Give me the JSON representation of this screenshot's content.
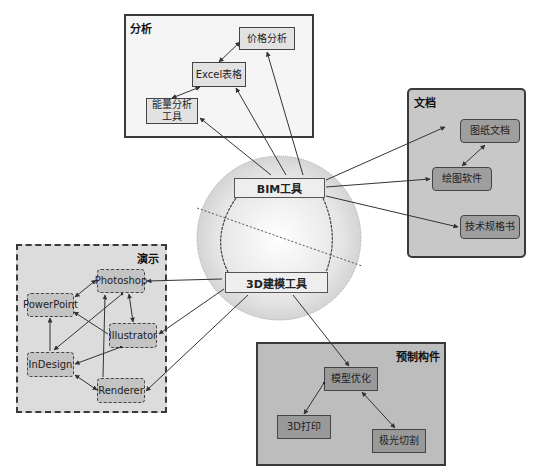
{
  "colors": {
    "analysis_bg": "#f5f5f5",
    "analysis_node": "#e2e2e2",
    "docs_bg": "#c8c8c8",
    "docs_node": "#9e9e9e",
    "demo_bg": "#dcdcdc",
    "demo_node": "#c4c4c4",
    "prefab_bg": "#bdbdbd",
    "prefab_node": "#999999",
    "hub_circle": "#d4d4d4"
  },
  "hub": {
    "bim": "BIM工具",
    "modeling": "3D建模工具"
  },
  "groups": {
    "analysis": {
      "title": "分析",
      "nodes": [
        "价格分析",
        "Excel表格",
        "能量分析\n工具"
      ]
    },
    "docs": {
      "title": "文档",
      "nodes": [
        "图纸文档",
        "绘图软件",
        "技术规格书"
      ]
    },
    "demo": {
      "title": "演示",
      "nodes": [
        "Photoshop",
        "PowerPoint",
        "Illustrator",
        "InDesign",
        "Renderer"
      ]
    },
    "prefab": {
      "title": "预制构件",
      "nodes": [
        "模型优化",
        "3D打印",
        "极光切割"
      ]
    }
  }
}
